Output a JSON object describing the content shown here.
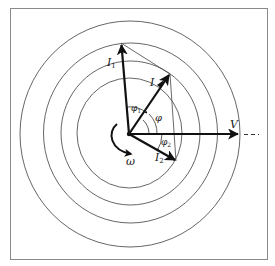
{
  "diagram": {
    "type": "phasor-diagram",
    "colors": {
      "background": "#ffffff",
      "frame": "#8a8a8a",
      "circles": "#555555",
      "vectors": "#111111",
      "thin_lines": "#444444"
    },
    "labels": {
      "I1": "I",
      "I1_sub": "1",
      "I": "I",
      "I2": "I",
      "I2_sub": "2",
      "V": "V",
      "phi": "φ",
      "phi1": "φ",
      "phi1_sub": "1",
      "phi2": "φ",
      "phi2_sub": "2",
      "omega": "ω"
    }
  }
}
